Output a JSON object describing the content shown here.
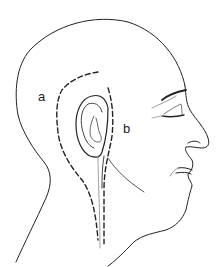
{
  "figure": {
    "labels": {
      "a": "a",
      "b": "b"
    },
    "colors": {
      "line": "#222222",
      "background": "#ffffff"
    }
  }
}
